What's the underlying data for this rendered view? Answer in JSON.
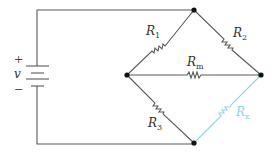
{
  "diagram": {
    "type": "circuit",
    "source": {
      "plus": "+",
      "label": "v",
      "minus": "−"
    },
    "resistors": [
      {
        "id": "R1",
        "main": "R",
        "sub": "1"
      },
      {
        "id": "R2",
        "main": "R",
        "sub": "2"
      },
      {
        "id": "Rm",
        "main": "R",
        "sub": "m"
      },
      {
        "id": "R3",
        "main": "R",
        "sub": "3"
      },
      {
        "id": "Rx",
        "main": "R",
        "sub": "x",
        "highlighted": true
      }
    ],
    "colors": {
      "wire": "#5a5a5a",
      "highlight": "#8fd3e6",
      "node": "#111111"
    }
  }
}
